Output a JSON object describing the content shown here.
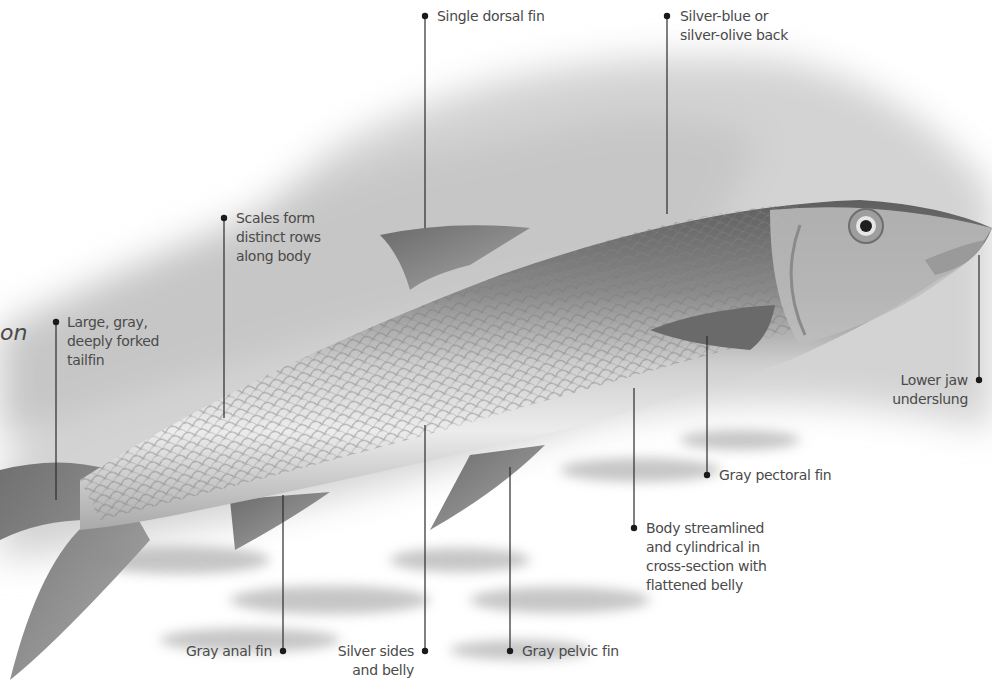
{
  "figure": {
    "title_fragment": "on",
    "colors": {
      "background": "#ffffff",
      "wash": "#d9d9d9",
      "fish_dark": "#6e6e6e",
      "fish_light": "#e8e8e8",
      "label_text": "#4a4a4a",
      "leader": "#2a2a2a"
    }
  },
  "labels": [
    {
      "id": "tailfin",
      "lines": [
        "Large, gray,",
        "deeply forked",
        "tailfin"
      ]
    },
    {
      "id": "scales",
      "lines": [
        "Scales form",
        "distinct rows",
        "along body"
      ]
    },
    {
      "id": "dorsal",
      "lines": [
        "Single dorsal fin"
      ]
    },
    {
      "id": "back",
      "lines": [
        "Silver-blue or",
        "silver-olive back"
      ]
    },
    {
      "id": "jaw",
      "lines": [
        "Lower jaw",
        "underslung"
      ]
    },
    {
      "id": "pectoral",
      "lines": [
        "Gray pectoral fin"
      ]
    },
    {
      "id": "body",
      "lines": [
        "Body streamlined",
        "and cylindrical in",
        "cross-section with",
        "flattened belly"
      ]
    },
    {
      "id": "anal",
      "lines": [
        "Gray anal fin"
      ]
    },
    {
      "id": "sides",
      "lines": [
        "Silver sides",
        "and belly"
      ]
    },
    {
      "id": "pelvic",
      "lines": [
        "Gray pelvic fin"
      ]
    }
  ]
}
